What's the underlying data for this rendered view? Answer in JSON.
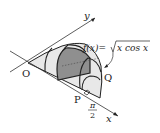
{
  "diagram": {
    "axes": {
      "x_label": "x",
      "y_label": "y",
      "origin_label": "O"
    },
    "points": {
      "P": "P",
      "Q": "Q"
    },
    "tick": {
      "numerator": "π",
      "denominator": "2"
    },
    "function_label": {
      "lhs": "f(x)=",
      "radicand": "x cos x"
    },
    "colors": {
      "stroke": "#222222",
      "base_fill": "#d9d9d9",
      "solid_fill": "#e6e6e6",
      "highlight_fill": "#8c8c8c"
    }
  }
}
